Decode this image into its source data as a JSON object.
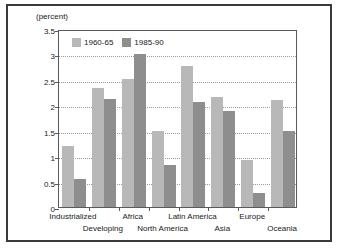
{
  "chart_data": {
    "type": "bar",
    "title": "",
    "subtitle": "",
    "unit_label": "(percent)",
    "xlabel": "",
    "ylabel": "",
    "ylim": [
      0,
      3.5
    ],
    "ytick_labels": [
      "0",
      "0.5",
      "1",
      "1.5",
      "2",
      "2.5",
      "3",
      "3.5"
    ],
    "ytick_values": [
      0,
      0.5,
      1,
      1.5,
      2,
      2.5,
      3,
      3.5
    ],
    "grid": true,
    "grid_axis": "y",
    "legend_position": "top-left-inside",
    "categories": [
      "Industrialized",
      "Developing",
      "Africa",
      "North America",
      "Latin America",
      "Asia",
      "Europe",
      "Oceania"
    ],
    "category_label_rows": [
      0,
      1,
      0,
      1,
      0,
      1,
      0,
      1
    ],
    "series": [
      {
        "name": "1960-65",
        "color": "#b8b8b8",
        "values": [
          1.19,
          2.35,
          2.52,
          1.5,
          2.78,
          2.17,
          0.93,
          2.1
        ]
      },
      {
        "name": "1985-90",
        "color": "#8e8e8e",
        "values": [
          0.55,
          2.12,
          3.0,
          0.83,
          2.06,
          1.88,
          0.27,
          1.5
        ]
      }
    ]
  }
}
